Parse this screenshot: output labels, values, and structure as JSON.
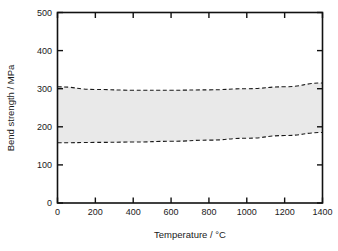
{
  "chart_data": {
    "type": "area",
    "title": "",
    "subtitle": "",
    "xlabel": "Temperature / °C",
    "ylabel": "Bend strength / MPa",
    "xlim": [
      0,
      1400
    ],
    "ylim": [
      0,
      500
    ],
    "xticks": [
      0,
      200,
      400,
      600,
      800,
      1000,
      1200,
      1400
    ],
    "yticks": [
      0,
      100,
      200,
      300,
      400,
      500
    ],
    "xtick_labels": [
      "0",
      "200",
      "400",
      "600",
      "800",
      "1000",
      "1200",
      "1400"
    ],
    "ytick_labels": [
      "0",
      "100",
      "200",
      "300",
      "400",
      "500"
    ],
    "grid": false,
    "legend": "none",
    "band": {
      "name": "Bend strength scatter band",
      "fill_color": "#e9e9e9",
      "edge_style": "dashed",
      "edge_color": "#1a1a1a",
      "x": [
        0,
        200,
        400,
        600,
        800,
        1000,
        1200,
        1400
      ],
      "upper": [
        305,
        298,
        296,
        296,
        297,
        300,
        305,
        315
      ],
      "lower": [
        158,
        159,
        160,
        162,
        165,
        170,
        177,
        185
      ]
    },
    "annotations": []
  },
  "figure": {
    "axis_color": "#111111",
    "background": "#ffffff",
    "tick_direction": "in"
  }
}
